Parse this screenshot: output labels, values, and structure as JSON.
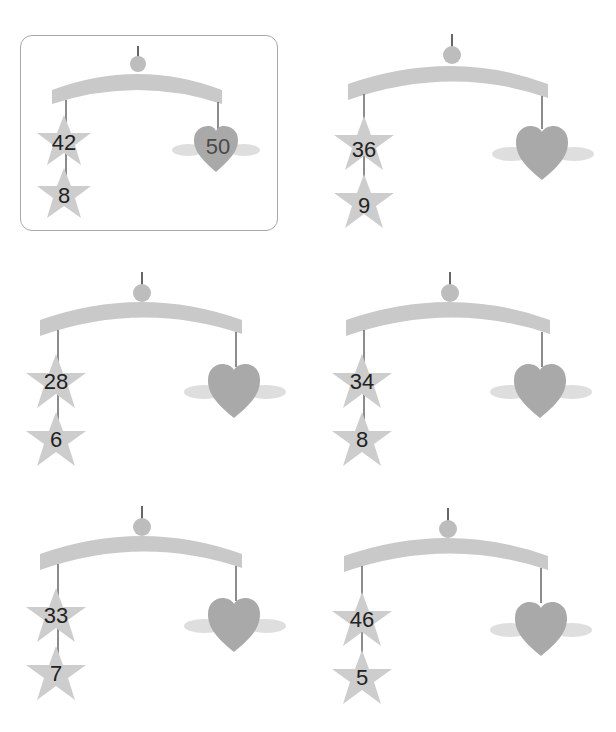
{
  "colors": {
    "bar": "#c9c9c9",
    "ball": "#bdbdbd",
    "string": "#666666",
    "star": "#cdcdcd",
    "heart": "#a9a9a9",
    "wing": "#dedede",
    "example_border": "#a8a8a8",
    "text": "#222222"
  },
  "mobiles": [
    {
      "id": "example",
      "example": true,
      "ox": 0,
      "oy": 0,
      "top_star": "42",
      "bottom_star": "8",
      "heart": "50"
    },
    {
      "id": "m2",
      "example": false,
      "ox": 312,
      "oy": -6,
      "top_star": "36",
      "bottom_star": "9",
      "heart": ""
    },
    {
      "id": "m3",
      "example": false,
      "ox": 4,
      "oy": 232,
      "top_star": "28",
      "bottom_star": "6",
      "heart": ""
    },
    {
      "id": "m4",
      "example": false,
      "ox": 310,
      "oy": 232,
      "top_star": "34",
      "bottom_star": "8",
      "heart": ""
    },
    {
      "id": "m5",
      "example": false,
      "ox": 4,
      "oy": 466,
      "top_star": "33",
      "bottom_star": "7",
      "heart": ""
    },
    {
      "id": "m6",
      "example": false,
      "ox": 308,
      "oy": 468,
      "top_star": "46",
      "bottom_star": "5",
      "heart": ""
    }
  ]
}
